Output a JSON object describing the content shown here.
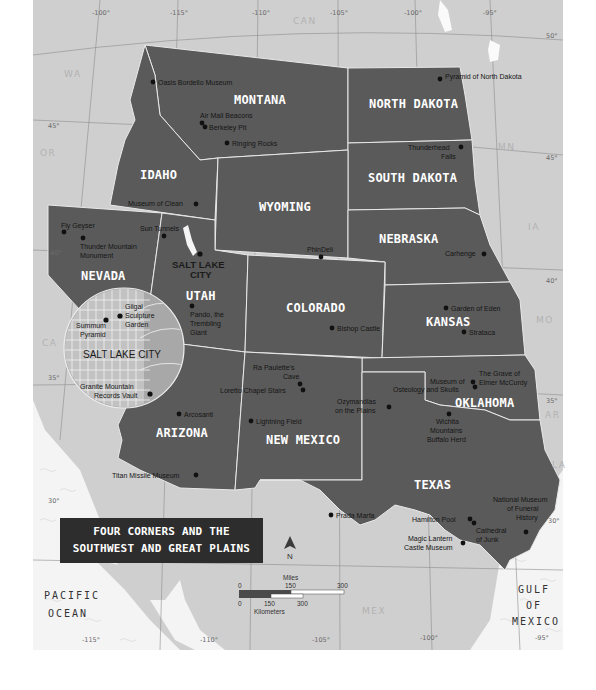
{
  "title": {
    "line1": "FOUR CORNERS AND THE",
    "line2": "SOUTHWEST AND GREAT PLAINS"
  },
  "colors": {
    "featured_states": "#5a5a5a",
    "other_land": "#cfcfcf",
    "water": "#f4f4f4",
    "title_bg": "#2d2d2d"
  },
  "longitudes": [
    "-100°",
    "-115°",
    "-110°",
    "-105°",
    "-100°",
    "-95°"
  ],
  "longitudes_bottom": [
    "-115°",
    "-110°",
    "-105°",
    "-100°",
    "-95°"
  ],
  "latitudes": [
    "50°",
    "45°",
    "45°",
    "40°",
    "40°",
    "35°",
    "35°",
    "30°",
    "30°"
  ],
  "regions": {
    "can": "CAN",
    "wa": "WA",
    "or": "OR",
    "ca": "CA",
    "mn": "MN",
    "ia": "IA",
    "mo": "MO",
    "ar": "AR",
    "la": "LA",
    "mex": "MEX"
  },
  "states": {
    "montana": "MONTANA",
    "north_dakota": "NORTH DAKOTA",
    "idaho": "IDAHO",
    "south_dakota": "SOUTH DAKOTA",
    "wyoming": "WYOMING",
    "nebraska": "NEBRASKA",
    "nevada": "NEVADA",
    "utah": "UTAH",
    "colorado": "COLORADO",
    "kansas": "KANSAS",
    "oklahoma": "OKLAHOMA",
    "arizona": "ARIZONA",
    "new_mexico": "NEW MEXICO",
    "texas": "TEXAS"
  },
  "cities": {
    "salt_lake_city_1": "SALT LAKE",
    "salt_lake_city_2": "CITY"
  },
  "pois": {
    "oasis_bordello": "Oasis Bordello Museum",
    "air_mail_beacons": "Air Mail Beacons",
    "berkeley_pit": "Berkeley Pit",
    "ringing_rocks": "Ringing Rocks",
    "pyramid_nd": "Pyramid of North Dakota",
    "thunderhead_1": "Thunderhead",
    "thunderhead_2": "Falls",
    "museum_of_clean": "Museum of Clean",
    "fly_geyser": "Fly Geyser",
    "thunder_mountain_1": "Thunder Mountain",
    "thunder_mountain_2": "Monument",
    "sun_tunnels": "Sun Tunnels",
    "phindeli": "PhinDeli",
    "carhenge": "Carhenge",
    "pando_1": "Pando, the",
    "pando_2": "Trembling",
    "pando_3": "Giant",
    "garden_of_eden": "Garden of Eden",
    "strataca": "Strataca",
    "bishop_castle": "Bishop Castle",
    "ra_paulette_1": "Ra Paulette's",
    "ra_paulette_2": "Cave",
    "loretto": "Loretto Chapel Stairs",
    "grave_mccurdy_1": "The Grave of",
    "grave_mccurdy_2": "Elmer McCurdy",
    "osteology_1": "Museum of",
    "osteology_2": "Osteology and Skulls",
    "ozymandias_1": "Ozymandias",
    "ozymandias_2": "on the Plains",
    "wichita_1": "Wichita",
    "wichita_2": "Mountains",
    "wichita_3": "Buffalo Herd",
    "arcosanti": "Arcosanti",
    "lightning_field": "Lightning Field",
    "titan_missile": "Titan Missile Museum",
    "prada_marfa": "Prada Marfa",
    "hamilton_pool": "Hamilton Pool",
    "funeral_1": "National Museum",
    "funeral_2": "of Funeral",
    "funeral_3": "History",
    "cathedral_1": "Cathedral",
    "cathedral_2": "of Junk",
    "magic_lantern_1": "Magic Lantern",
    "magic_lantern_2": "Castle Museum"
  },
  "inset": {
    "title": "SALT LAKE CITY",
    "gilgal_1": "Gilgal",
    "gilgal_2": "Sculpture",
    "gilgal_3": "Garden",
    "summum_1": "Summum",
    "summum_2": "Pyramid",
    "granite_1": "Granite Mountain",
    "granite_2": "Records Vault"
  },
  "oceans": {
    "pacific_1": "PACIFIC",
    "pacific_2": "OCEAN",
    "gulf_1": "GULF",
    "gulf_2": "OF",
    "gulf_3": "MEXICO"
  },
  "compass": {
    "label": "N"
  },
  "scale": {
    "miles_label": "Miles",
    "miles_ticks": [
      "0",
      "150",
      "300"
    ],
    "km_label": "Kilometers",
    "km_ticks": [
      "0",
      "150",
      "300"
    ]
  }
}
